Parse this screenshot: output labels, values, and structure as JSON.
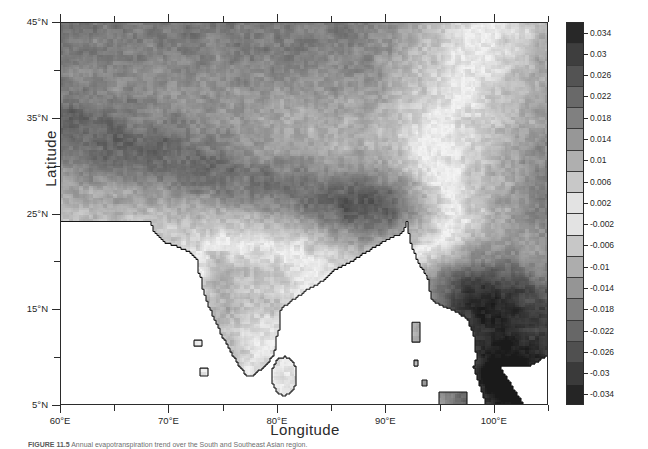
{
  "figure": {
    "caption_id": "FIGURE 11.5",
    "caption_text": "  Annual evapotranspiration trend over the South and Southeast Asian region."
  },
  "axes": {
    "xlabel": "Longitude",
    "ylabel": "Latitude",
    "x_major_ticks": [
      "60°E",
      "70°E",
      "80°E",
      "90°E",
      "100°E"
    ],
    "y_major_ticks": [
      "45°N",
      "35°N",
      "25°N",
      "15°N",
      "5°N"
    ]
  },
  "colorbar": {
    "title": "Evapotranspiration trend (mm/year)",
    "labels": [
      "0.034",
      "0.03",
      "0.026",
      "0.022",
      "0.018",
      "0.014",
      "0.01",
      "0.006",
      "0.002",
      "-0.002",
      "-0.006",
      "-0.01",
      "-0.014",
      "-0.018",
      "-0.022",
      "-0.026",
      "-0.03",
      "-0.034"
    ],
    "high_color": "#1e1e1e",
    "mid_color": "#f2f2f2",
    "low_color": "#2a2a2a"
  },
  "chart_data": {
    "type": "heatmap",
    "title": "Evapotranspiration trend",
    "xlabel": "Longitude",
    "ylabel": "Latitude",
    "xlim": [
      60,
      105
    ],
    "ylim": [
      5,
      45
    ],
    "grid": false,
    "legend_position": "right",
    "colorbar_label": "Evapotranspiration trend (mm/year)",
    "colorbar_ticks": [
      0.034,
      0.03,
      0.026,
      0.022,
      0.018,
      0.014,
      0.01,
      0.006,
      0.002,
      -0.002,
      -0.006,
      -0.01,
      -0.014,
      -0.018,
      -0.022,
      -0.026,
      -0.03,
      -0.034
    ],
    "colorbar_range": [
      -0.036,
      0.036
    ],
    "colormap": "grayscale-diverging",
    "x_tick_values": [
      60,
      70,
      80,
      90,
      100
    ],
    "x_tick_labels": [
      "60°E",
      "70°E",
      "80°E",
      "90°E",
      "100°E"
    ],
    "x_minor_tick_values": [
      65,
      75,
      85,
      95,
      105
    ],
    "y_tick_values": [
      45,
      35,
      25,
      15,
      5
    ],
    "y_tick_labels": [
      "45°N",
      "35°N",
      "25°N",
      "15°N",
      "5°N"
    ],
    "y_minor_tick_values": [
      40,
      30,
      20,
      10
    ],
    "regions": [
      {
        "name": "Central Asia / Tibetan Plateau",
        "approx_extent": [
          60,
          100,
          28,
          45
        ],
        "trend_sign": "slightly positive",
        "note": "broad mid-gray field, values near 0.006 to 0.014"
      },
      {
        "name": "Himalayan foothills / Indo-Gangetic Plain",
        "approx_extent": [
          72,
          88,
          24,
          32
        ],
        "trend_sign": "positive",
        "note": "light band, values near 0.002 to 0.01"
      },
      {
        "name": "Western Ghats / Peninsular India",
        "approx_extent": [
          72,
          82,
          8,
          22
        ],
        "trend_sign": "negative",
        "note": "darker gray, values near -0.006 to -0.014"
      },
      {
        "name": "Myanmar / Indochina",
        "approx_extent": [
          92,
          105,
          10,
          28
        ],
        "trend_sign": "negative",
        "note": "dark gray to near-black, values near -0.014 to -0.03"
      },
      {
        "name": "Malay Peninsula",
        "approx_extent": [
          98,
          104,
          5,
          12
        ],
        "trend_sign": "strongly negative",
        "note": "darkest pixels, values near -0.026 to -0.034"
      },
      {
        "name": "Sri Lanka",
        "approx_extent": [
          79.5,
          82,
          5.8,
          9.9
        ],
        "trend_sign": "negative",
        "note": "mid-dark gray"
      },
      {
        "name": "Ocean / no-data",
        "approx_extent": [
          60,
          100,
          5,
          24
        ],
        "trend_sign": "masked",
        "note": "rendered white, no values"
      }
    ]
  }
}
